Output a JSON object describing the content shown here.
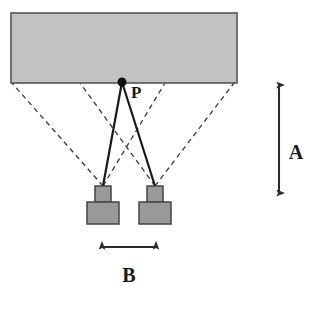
{
  "diagram": {
    "background_color": "#ffffff",
    "stroke_color": "#3a3a3a",
    "labels": {
      "point": "P",
      "range": "A",
      "baseline": "B"
    },
    "surface": {
      "name": "target-surface",
      "fill_color": "#c2c2c2",
      "stroke_color": "#555555",
      "x": 11,
      "y": 13,
      "width": 226,
      "height": 70
    },
    "scene_point": {
      "name": "scene-point-P",
      "cx": 122,
      "cy": 82,
      "r": 4.5,
      "color": "#111111"
    },
    "cameras": [
      {
        "name": "left-camera",
        "lens": {
          "x": 95,
          "y": 186,
          "width": 16,
          "height": 16
        },
        "body": {
          "x": 87,
          "y": 202,
          "width": 32,
          "height": 22
        },
        "fill_color": "#999999",
        "stroke_color": "#444444",
        "apex_x": 103,
        "apex_y": 186
      },
      {
        "name": "right-camera",
        "lens": {
          "x": 147,
          "y": 186,
          "width": 16,
          "height": 16
        },
        "body": {
          "x": 139,
          "y": 202,
          "width": 32,
          "height": 22
        },
        "fill_color": "#999999",
        "stroke_color": "#444444",
        "apex_x": 155,
        "apex_y": 186
      }
    ],
    "sight_lines": [
      {
        "name": "sight-line-P-to-left-camera",
        "style": "solid",
        "x1": 122,
        "y1": 82,
        "x2": 103,
        "y2": 186
      },
      {
        "name": "sight-line-P-to-right-camera",
        "style": "solid",
        "x1": 122,
        "y1": 82,
        "x2": 155,
        "y2": 186
      }
    ],
    "view_cone_lines": [
      {
        "name": "fov-line-left-camera-outer",
        "style": "dashed",
        "x1": 103,
        "y1": 186,
        "x2": 12,
        "y2": 83
      },
      {
        "name": "fov-line-left-camera-inner",
        "style": "dashed",
        "x1": 103,
        "y1": 186,
        "x2": 165,
        "y2": 83
      },
      {
        "name": "fov-line-right-camera-inner",
        "style": "dashed",
        "x1": 155,
        "y1": 186,
        "x2": 80,
        "y2": 83
      },
      {
        "name": "fov-line-right-camera-outer",
        "style": "dashed",
        "x1": 155,
        "y1": 186,
        "x2": 234,
        "y2": 83
      }
    ],
    "range_arrow": {
      "name": "range-dimension-arrow",
      "x": 279,
      "y_top": 85,
      "y_bottom": 193,
      "label_x": 296,
      "label_y": 152
    },
    "baseline_arrow": {
      "name": "baseline-dimension-arrow",
      "y": 247,
      "x_left": 102,
      "x_right": 156,
      "label_x": 129,
      "label_y": 275
    }
  }
}
